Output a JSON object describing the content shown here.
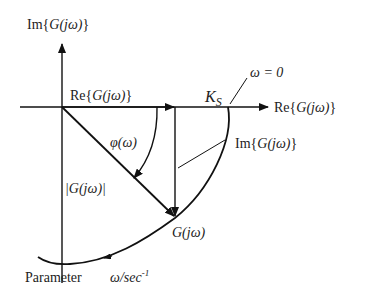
{
  "diagram": {
    "type": "nyquist-plot-explanation",
    "labels": {
      "im_axis": {
        "prefix": "Im{",
        "func": "G(jω)",
        "suffix": "}"
      },
      "re_axis": {
        "prefix": "Re{",
        "func": "G(jω)",
        "suffix": "}"
      },
      "re_component": {
        "prefix": "Re{",
        "func": "G(jω)",
        "suffix": "}"
      },
      "im_component": {
        "prefix": "Im{",
        "func": "G(jω)",
        "suffix": "}"
      },
      "static_gain": "K",
      "static_gain_sub": "S",
      "omega_zero": "ω = 0",
      "phase": "φ(ω)",
      "magnitude": "|G(jω)|",
      "point": "G(jω)",
      "parameter": "Parameter",
      "parameter_unit": "ω/sec",
      "parameter_unit_exp": "-1"
    },
    "colors": {
      "line": "#111111",
      "text": "#222222",
      "background": "#ffffff"
    }
  }
}
